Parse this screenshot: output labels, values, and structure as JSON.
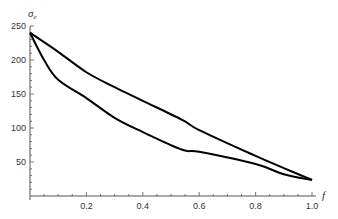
{
  "chart_data": {
    "type": "line",
    "title": "",
    "xlabel": "f",
    "ylabel": "σ",
    "ylabel_subscript": "e",
    "xlim": [
      0,
      1.0
    ],
    "ylim": [
      0,
      250
    ],
    "axes_origin": [
      0,
      0
    ],
    "grid": false,
    "legend": "none",
    "x_ticks": [
      0.2,
      0.4,
      0.6,
      0.8,
      1.0
    ],
    "x_tick_labels": [
      "0.2",
      "0.4",
      "0.6",
      "0.8",
      "1.0"
    ],
    "y_ticks": [
      50,
      100,
      150,
      200,
      250
    ],
    "y_tick_labels": [
      "50",
      "100",
      "150",
      "200",
      "250"
    ],
    "line_color": "#000000",
    "series": [
      {
        "name": "upper",
        "x": [
          0,
          0.1,
          0.2,
          0.3,
          0.4,
          0.54,
          0.6,
          0.8,
          0.9,
          1.0
        ],
        "y": [
          240,
          212,
          182,
          160,
          140,
          112,
          97,
          59,
          41,
          23.5
        ]
      },
      {
        "name": "lower",
        "x": [
          0,
          0.05,
          0.1,
          0.2,
          0.3,
          0.4,
          0.54,
          0.6,
          0.8,
          0.9,
          1.0
        ],
        "y": [
          240,
          200,
          171,
          144,
          115,
          94,
          68,
          65,
          47,
          32,
          23.5
        ]
      }
    ]
  }
}
